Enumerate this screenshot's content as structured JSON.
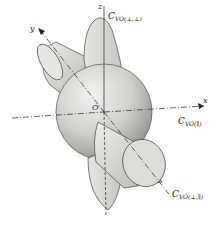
{
  "figure": {
    "axes": {
      "x_label": "x",
      "y_label": "y",
      "z_label": "z",
      "origin_label": "O"
    },
    "lobes": [
      {
        "symbol": "C",
        "subscript": "VO(⊥,⊥)",
        "description": "flat lobe along z-axis"
      },
      {
        "symbol": "C",
        "subscript": "VO(∥)",
        "description": "sphere at origin"
      },
      {
        "symbol": "C",
        "subscript": "VO(⊥,∥)",
        "description": "cylinder along tilted axis"
      }
    ],
    "colors": {
      "shape_fill": "#d9d9d6",
      "shape_dark": "#9a9a96",
      "line": "#333333",
      "background": "#ffffff"
    }
  }
}
